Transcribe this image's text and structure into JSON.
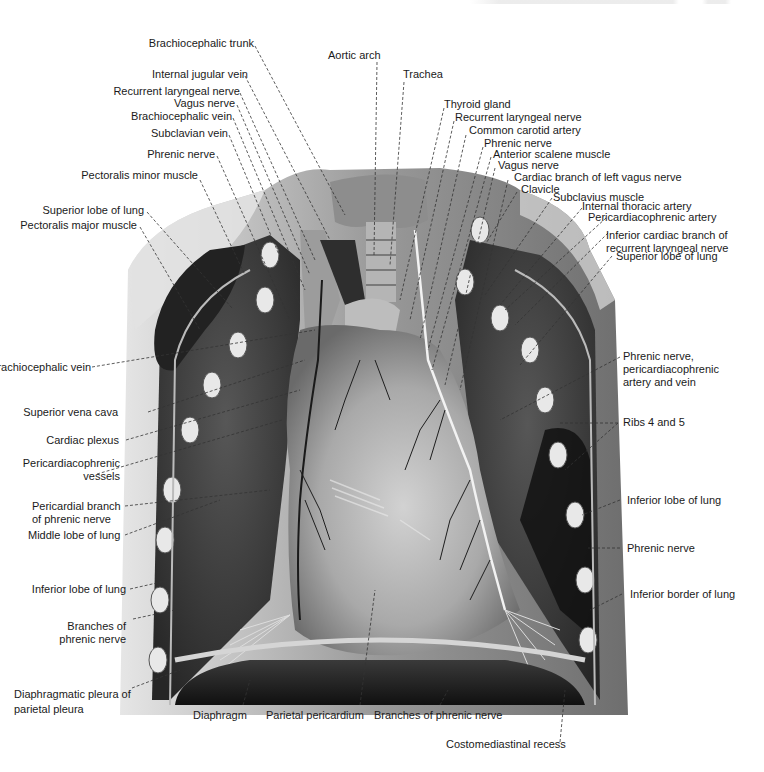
{
  "figure": {
    "palette": {
      "background": "#ffffff",
      "text": "#1a1a1a",
      "chest_wall": "#8c8c8c",
      "chest_wall_light": "#d9d9d9",
      "lung_dark": "#2b2b2b",
      "lung_mid": "#4a4a4a",
      "pericardium": "#a8a8a8",
      "pericardium_highlight": "#c9c9c9",
      "diaphragm": "#1e1e1e",
      "rib": "#e8e8e8",
      "leader_line": "#333333"
    }
  },
  "labels": {
    "left": [
      {
        "id": "brachiocephalic-trunk",
        "text": "Brachiocephalic trunk"
      },
      {
        "id": "internal-jugular-vein",
        "text": "Internal jugular vein"
      },
      {
        "id": "recurrent-laryngeal-nerve-right",
        "text": "Recurrent laryngeal nerve"
      },
      {
        "id": "vagus-nerve-right",
        "text": "Vagus nerve"
      },
      {
        "id": "brachiocephalic-vein-upper",
        "text": "Brachiocephalic vein"
      },
      {
        "id": "subclavian-vein",
        "text": "Subclavian vein"
      },
      {
        "id": "phrenic-nerve-right",
        "text": "Phrenic nerve"
      },
      {
        "id": "pectoralis-minor-muscle",
        "text": "Pectoralis minor muscle"
      },
      {
        "id": "superior-lobe-of-lung-right",
        "text": "Superior lobe of lung"
      },
      {
        "id": "pectoralis-major-muscle",
        "text": "Pectoralis major muscle"
      },
      {
        "id": "brachiocephalic-vein-lower",
        "text": "Brachiocephalic vein"
      },
      {
        "id": "superior-vena-cava",
        "text": "Superior vena cava"
      },
      {
        "id": "cardiac-plexus",
        "text": "Cardiac plexus"
      },
      {
        "id": "pericardiacophrenic-vessels",
        "line1": "Pericardiacophrenic",
        "line2": "vessels"
      },
      {
        "id": "pericardial-branch-phrenic",
        "line1": "Pericardial branch",
        "line2": "of phrenic nerve"
      },
      {
        "id": "middle-lobe-of-lung",
        "text": "Middle lobe of lung"
      },
      {
        "id": "inferior-lobe-of-lung-right",
        "text": "Inferior lobe of lung"
      },
      {
        "id": "branches-of-phrenic-nerve-left-side",
        "line1": "Branches of",
        "line2": "phrenic nerve"
      },
      {
        "id": "diaphragmatic-pleura",
        "line1": "Diaphragmatic pleura of",
        "line2": "parietal pleura"
      }
    ],
    "top": [
      {
        "id": "aortic-arch",
        "text": "Aortic arch"
      },
      {
        "id": "trachea",
        "text": "Trachea"
      }
    ],
    "right": [
      {
        "id": "thyroid-gland",
        "text": "Thyroid gland"
      },
      {
        "id": "recurrent-laryngeal-nerve-left",
        "text": "Recurrent laryngeal nerve"
      },
      {
        "id": "common-carotid-artery",
        "text": "Common carotid artery"
      },
      {
        "id": "phrenic-nerve-left-upper",
        "text": "Phrenic nerve"
      },
      {
        "id": "anterior-scalene-muscle",
        "text": "Anterior scalene muscle"
      },
      {
        "id": "vagus-nerve-left",
        "text": "Vagus nerve"
      },
      {
        "id": "cardiac-branch-left-vagus",
        "text": "Cardiac branch of left vagus nerve"
      },
      {
        "id": "clavicle",
        "text": "Clavicle"
      },
      {
        "id": "subclavius-muscle",
        "text": "Subclavius muscle"
      },
      {
        "id": "internal-thoracic-artery",
        "text": "Internal thoracic artery"
      },
      {
        "id": "pericardiacophrenic-artery",
        "text": "Pericardiacophrenic artery"
      },
      {
        "id": "inferior-cardiac-branch",
        "line1": "Inferior cardiac branch of",
        "line2": "recurrent laryngeal nerve"
      },
      {
        "id": "superior-lobe-of-lung-left",
        "text": "Superior lobe of lung"
      },
      {
        "id": "phrenic-nerve-pericardiacophrenic",
        "line1": "Phrenic nerve,",
        "line2": "pericardiacophrenic",
        "line3": "artery and vein"
      },
      {
        "id": "ribs-4-and-5",
        "text": "Ribs 4 and 5"
      },
      {
        "id": "inferior-lobe-of-lung-left",
        "text": "Inferior lobe of lung"
      },
      {
        "id": "phrenic-nerve-left-lower",
        "text": "Phrenic nerve"
      },
      {
        "id": "inferior-border-of-lung",
        "text": "Inferior border of lung"
      }
    ],
    "bottom": [
      {
        "id": "diaphragm",
        "text": "Diaphragm"
      },
      {
        "id": "parietal-pericardium",
        "text": "Parietal pericardium"
      },
      {
        "id": "branches-of-phrenic-nerve-bottom",
        "text": "Branches of phrenic nerve"
      },
      {
        "id": "costomediastinal-recess",
        "text": "Costomediastinal recess"
      }
    ]
  }
}
